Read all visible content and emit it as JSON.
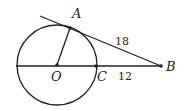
{
  "diagram": {
    "points": {
      "A": "A",
      "B": "B",
      "O": "O",
      "C": "C"
    },
    "lengths": {
      "AB": "18",
      "CB": "12"
    },
    "colors": {
      "stroke": "#222222",
      "background": "#ffffff"
    }
  }
}
